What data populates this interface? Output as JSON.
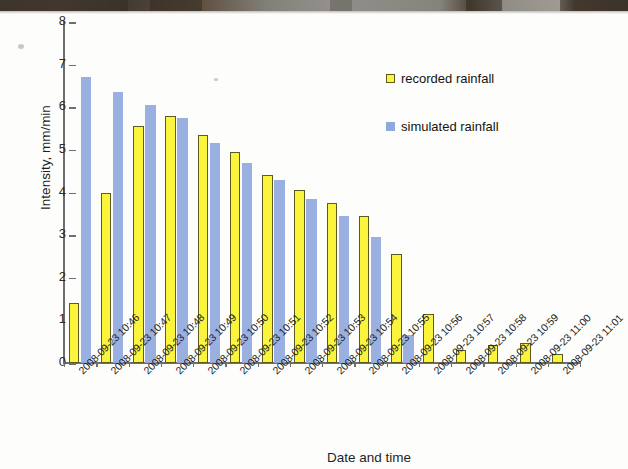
{
  "chart_data": {
    "type": "bar",
    "title": "",
    "xlabel": "Date and time",
    "ylabel": "Intensity, mm/min",
    "ylim": [
      0,
      8
    ],
    "ytick_labels": [
      "8",
      "7",
      "6",
      "5",
      "4",
      "3",
      "2",
      "1",
      "0"
    ],
    "ytick_values": [
      8,
      7,
      6,
      5,
      4,
      3,
      2,
      1,
      0
    ],
    "grid": false,
    "legend_position": "upper-right-inside",
    "categories": [
      "2008-09-23 10:46",
      "2008-09-23 10:47",
      "2008-09-23 10:48",
      "2008-09-23 10:49",
      "2008-09-23 10:50",
      "2008-09-23 10:51",
      "2008-09-23 10:52",
      "2008-09-23 10:53",
      "2008-09-23 10:54",
      "2008-09-23 10:55",
      "2008-09-23 10:56",
      "2008-09-23 10:57",
      "2008-09-23 10:58",
      "2008-09-23 10:59",
      "2008-09-23 11:00",
      "2008-09-23 11:01"
    ],
    "series": [
      {
        "name": "recorded rainfall",
        "color": "#fbf43c",
        "edge_color": "#5e5a20",
        "values": [
          1.4,
          3.98,
          5.55,
          5.8,
          5.35,
          4.95,
          4.4,
          4.05,
          3.75,
          3.45,
          2.55,
          1.15,
          0.3,
          0.42,
          0.47,
          0.22
        ]
      },
      {
        "name": "simulated rainfall",
        "color": "#90a9dd",
        "edge_color": "#90a9dd",
        "values": [
          6.72,
          6.36,
          6.05,
          5.75,
          5.15,
          4.7,
          4.3,
          3.85,
          3.45,
          2.95,
          0.65,
          0,
          0,
          0,
          0,
          0
        ]
      }
    ]
  },
  "legend": {
    "items": [
      {
        "label": "recorded rainfall",
        "marker": "square-yellow-outlined"
      },
      {
        "label": "simulated rainfall",
        "marker": "square-blue"
      }
    ]
  },
  "axes": {
    "y_title": "Intensity, mm/min",
    "x_title": "Date and time"
  }
}
